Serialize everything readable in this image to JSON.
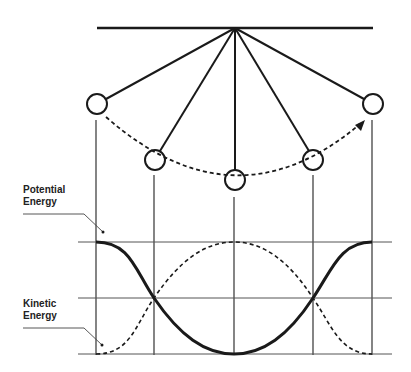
{
  "diagram": {
    "type": "pendulum-energy",
    "labels": {
      "potential": [
        "Potential",
        "Energy"
      ],
      "kinetic": [
        "Kinetic",
        "Energy"
      ]
    },
    "colors": {
      "line": "#1a1a1a",
      "grid": "#555555",
      "background": "#ffffff"
    },
    "pivot": {
      "x": 235,
      "y": 28
    },
    "ceiling": {
      "x1": 97,
      "x2": 373,
      "y": 28
    },
    "bobs": [
      {
        "position": "left-extreme",
        "x": 97,
        "y": 104
      },
      {
        "position": "left-mid",
        "x": 155,
        "y": 160
      },
      {
        "position": "bottom",
        "x": 235,
        "y": 180
      },
      {
        "position": "right-mid",
        "x": 313,
        "y": 160
      },
      {
        "position": "right-extreme",
        "x": 373,
        "y": 104
      }
    ],
    "bob_radius": 10,
    "swing_path": "dashed arc with arrow pointing toward right-extreme",
    "graph": {
      "verticals_x": [
        96,
        153,
        233,
        313,
        371
      ],
      "horizontals_y": [
        242,
        298,
        354
      ],
      "x_range": [
        78,
        392
      ],
      "potential_curve": "solid thick cosine: max at extremes, min at bottom",
      "kinetic_curve": "dashed sine: min at extremes, max at bottom"
    }
  }
}
